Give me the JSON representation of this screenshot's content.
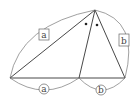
{
  "diagram": {
    "colors": {
      "stroke": "#333333",
      "arc": "#777777",
      "label": "#444444",
      "background": "#ffffff"
    },
    "points": {
      "apex": [
        95,
        10
      ],
      "left": [
        10,
        78
      ],
      "foot": [
        79,
        78
      ],
      "right": [
        125,
        78
      ]
    },
    "labels": {
      "side_left_boxed": "a",
      "side_right_boxed": "b",
      "base_left_circled": "a",
      "base_right_circled": "b"
    },
    "angle_marks": [
      "dot",
      "dot"
    ]
  }
}
